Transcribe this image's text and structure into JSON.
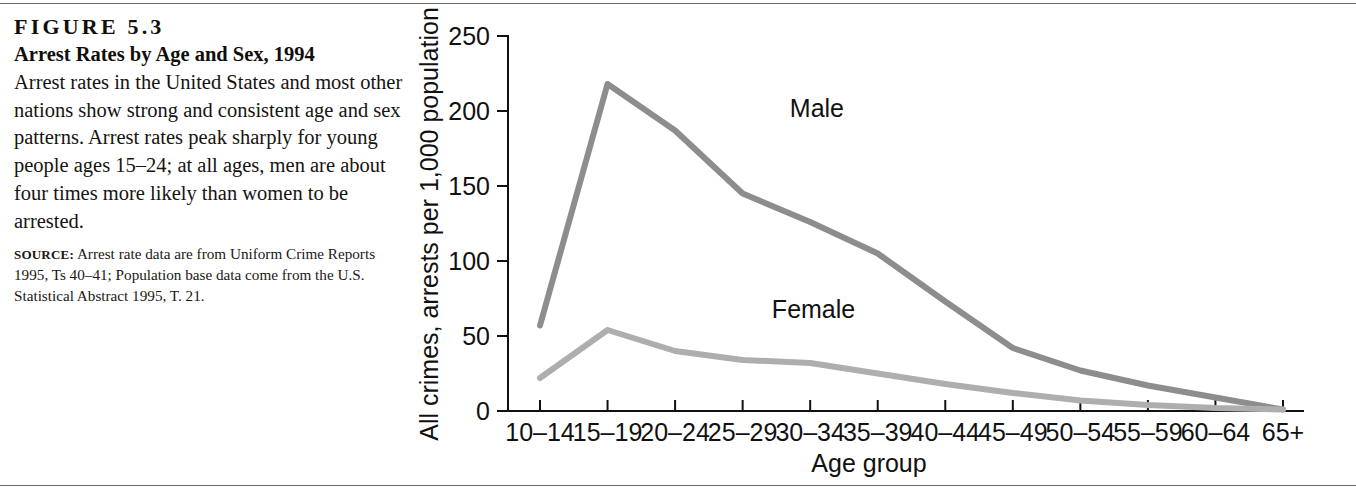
{
  "figure": {
    "number": "FIGURE 5.3",
    "title": "Arrest Rates by Age and Sex, 1994",
    "body": "Arrest rates in the United States and most other nations show strong and consistent age and sex patterns. Arrest rates peak sharply for young people ages 15–24; at all ages, men are about four times more likely than women to be arrested.",
    "source_label": "SOURCE:",
    "source_text": " Arrest rate data are from Uniform Crime Reports 1995, Ts 40–41; Population base data come from the U.S. Statistical Abstract 1995, T. 21."
  },
  "chart_data": {
    "type": "line",
    "title": "Arrest Rates by Age and Sex, 1994",
    "xlabel": "Age group",
    "ylabel": "All crimes, arrests per 1,000 population",
    "categories": [
      "10–14",
      "15–19",
      "20–24",
      "25–29",
      "30–34",
      "35–39",
      "40–44",
      "45–49",
      "50–54",
      "55–59",
      "60–64",
      "65+"
    ],
    "series": [
      {
        "name": "Male",
        "color": "#8d8d8d",
        "values": [
          57,
          218,
          187,
          145,
          126,
          105,
          73,
          42,
          27,
          17,
          9,
          1
        ],
        "label_x_category_index": 4.1,
        "label_value": 196
      },
      {
        "name": "Female",
        "color": "#aeaeae",
        "values": [
          22,
          54,
          40,
          34,
          32,
          25,
          18,
          12,
          7,
          4,
          2,
          1
        ],
        "label_x_category_index": 4.05,
        "label_value": 62
      }
    ],
    "yticks": [
      0,
      50,
      100,
      150,
      200,
      250
    ],
    "ylim": [
      0,
      250
    ],
    "grid": false,
    "legend": "inline-annotations"
  },
  "colors": {
    "axis": "#111111",
    "text": "#14110f",
    "rule": "#6b6b6b",
    "male_line": "#8d8d8d",
    "female_line": "#aeaeae"
  }
}
